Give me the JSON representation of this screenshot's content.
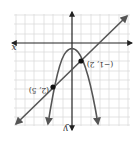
{
  "figure": {
    "orientation": "rotated-180",
    "axes": {
      "x_label": "x",
      "y_label": "y"
    },
    "curves": [
      {
        "name": "parabola",
        "kind": "downward parabola"
      },
      {
        "name": "line",
        "kind": "straight line"
      }
    ],
    "points": [
      {
        "label": "(−1, 2)"
      },
      {
        "label": "(2, 5)"
      }
    ],
    "colors": {
      "grid": "#d9d9d9",
      "axis": "#222222",
      "curve": "#555555",
      "point": "#111111"
    }
  }
}
